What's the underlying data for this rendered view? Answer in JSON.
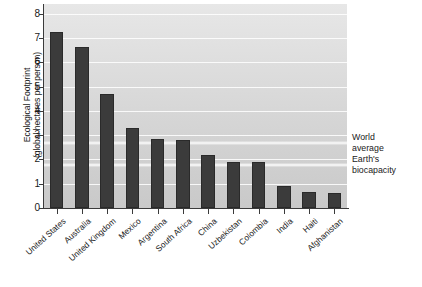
{
  "chart_data": {
    "type": "bar",
    "title": "",
    "xlabel": "",
    "ylabel": "Ecological Footprint\n(global hectares per person)",
    "ylim": [
      0,
      8.4
    ],
    "yticks": [
      0,
      1,
      2,
      3,
      4,
      5,
      6,
      7,
      8
    ],
    "ytick_labels": [
      "0",
      "1",
      "2",
      "3",
      "4",
      "5",
      "6",
      "7",
      "8"
    ],
    "grid": true,
    "legend_position": "none",
    "categories": [
      "United States",
      "Australia",
      "United Kingdom",
      "Mexico",
      "Argentina",
      "South Africa",
      "China",
      "Uzbekistan",
      "Colombia",
      "India",
      "Haiti",
      "Afghanistan"
    ],
    "values": [
      7.25,
      6.65,
      4.7,
      3.3,
      2.85,
      2.8,
      2.2,
      1.9,
      1.9,
      0.9,
      0.65,
      0.6
    ],
    "bar_color": "#3b3b3b",
    "plot_background": "#d6d6d6",
    "reference_lines": [
      {
        "label": "World\naverage",
        "value": 2.7,
        "color": "#f2f2f2"
      },
      {
        "label": "Earth's\nbiocapacity",
        "value": 1.8,
        "color": "#f2f2f2"
      }
    ]
  },
  "caption": {
    "text": ""
  }
}
